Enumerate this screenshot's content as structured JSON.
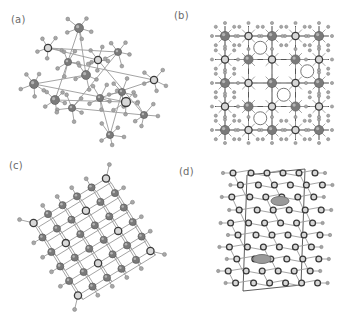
{
  "figure": {
    "panels": [
      {
        "id": "a",
        "label": "(a)",
        "description": "disordered ball-and-stick crystal structure"
      },
      {
        "id": "b",
        "label": "(b)",
        "description": "cubic lattice viewed along axis"
      },
      {
        "id": "c",
        "label": "(c)",
        "description": "rotated cubic lattice ball-and-stick"
      },
      {
        "id": "d",
        "label": "(d)",
        "description": "layered unit cell, elongated vertical"
      }
    ],
    "colors": {
      "background": "#ffffff",
      "atom_large": "#7a7a7a",
      "atom_small": "#a8a8a8",
      "atom_dark_ring": "#3a3a3a",
      "bond": "#9a9a9a",
      "label": "#6a6a6a"
    }
  }
}
